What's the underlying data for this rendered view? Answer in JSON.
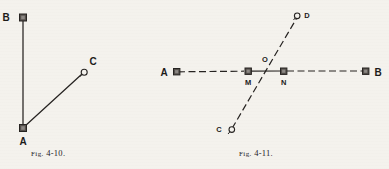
{
  "page": {
    "background_color": "#f4f2ed",
    "ink_color": "#262321",
    "width": 389,
    "height": 169
  },
  "figures": [
    {
      "id": "fig-4-10",
      "caption_prefix": "Fig.",
      "caption_number": "4-10.",
      "caption_full": "Fig. 4-10.",
      "points": [
        {
          "label": "B",
          "marker": "square-station",
          "x": 23,
          "y": 17
        },
        {
          "label": "A",
          "marker": "square-station",
          "x": 23,
          "y": 128
        },
        {
          "label": "C",
          "marker": "circle-pin",
          "x": 84,
          "y": 72
        }
      ],
      "lines": [
        {
          "name": "line-A-B",
          "from": "A",
          "to": "B",
          "style": "solid"
        },
        {
          "name": "line-A-C",
          "from": "A",
          "to": "C",
          "style": "solid"
        }
      ]
    },
    {
      "id": "fig-4-11",
      "caption_prefix": "Fig.",
      "caption_number": "4-11.",
      "caption_full": "Fig. 4-11.",
      "points": [
        {
          "label": "A",
          "marker": "square-station",
          "x": 173,
          "y": 71
        },
        {
          "label": "M",
          "marker": "square-station",
          "x": 248,
          "y": 71
        },
        {
          "label": "O",
          "marker": "intersection",
          "x": 266,
          "y": 71
        },
        {
          "label": "N",
          "marker": "square-station",
          "x": 283,
          "y": 71
        },
        {
          "label": "B",
          "marker": "square-station",
          "x": 367,
          "y": 71
        },
        {
          "label": "C",
          "marker": "circle-pin",
          "x": 230,
          "y": 131
        },
        {
          "label": "D",
          "marker": "circle-pin",
          "x": 298,
          "y": 15
        }
      ],
      "lines": [
        {
          "name": "line-A-M",
          "from": "A",
          "to": "M",
          "style": "dashed"
        },
        {
          "name": "line-M-N",
          "from": "M",
          "to": "N",
          "style": "solid"
        },
        {
          "name": "line-N-B",
          "from": "N",
          "to": "B",
          "style": "dashed"
        },
        {
          "name": "line-C-D",
          "from": "C",
          "to": "D",
          "style": "dashed"
        }
      ]
    }
  ]
}
